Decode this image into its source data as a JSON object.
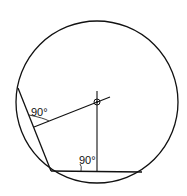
{
  "diagram": {
    "type": "geometry",
    "labels": {
      "angle_upper": "90°",
      "angle_lower": "90°"
    },
    "colors": {
      "stroke": "#111111",
      "background": "#ffffff"
    }
  }
}
